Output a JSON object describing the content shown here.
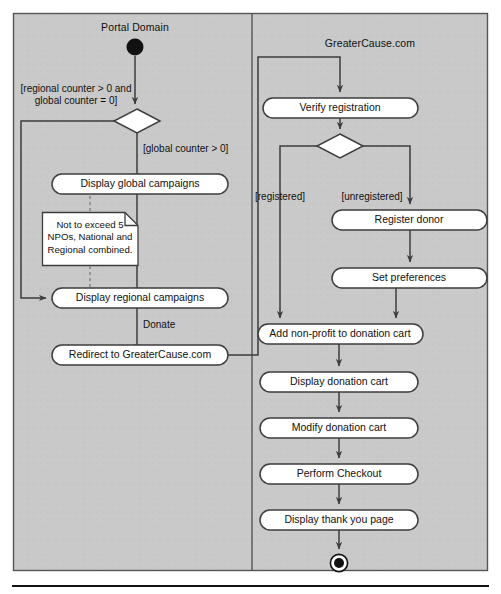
{
  "diagram": {
    "type": "uml-activity-diagram",
    "title": "",
    "frame": {
      "fill": "#c9c9c9",
      "stroke": "#4a4a4a",
      "x": 13,
      "y": 13,
      "width": 475,
      "height": 558
    },
    "swimlanes": [
      {
        "id": "portal",
        "name": "Portal Domain",
        "title_x": 135,
        "title_y": 24
      },
      {
        "id": "greatercause",
        "name": "GreaterCause.com",
        "title_x": 370,
        "title_y": 40
      }
    ],
    "divider_x": 252,
    "nodes": {
      "start": {
        "kind": "initial-node",
        "cx": 135,
        "cy": 47,
        "r": 8.5
      },
      "end": {
        "kind": "final-node",
        "cx": 339,
        "cy": 563,
        "r_outer": 9,
        "r_inner": 5
      },
      "decision_portal": {
        "kind": "decision",
        "cx": 137,
        "cy": 121,
        "hw": 23,
        "hh": 12
      },
      "decision_gc": {
        "kind": "decision",
        "cx": 340,
        "cy": 146,
        "hw": 23,
        "hh": 12
      }
    },
    "activities": [
      {
        "id": "display-global-campaigns",
        "label": "Display global campaigns",
        "x": 52,
        "y": 174,
        "w": 176,
        "h": 20,
        "lane": "portal"
      },
      {
        "id": "display-regional-campaigns",
        "label": "Display regional campaigns",
        "x": 52,
        "y": 288,
        "w": 176,
        "h": 20,
        "lane": "portal"
      },
      {
        "id": "redirect-to-greatercause",
        "label": "Redirect to GreaterCause.com",
        "x": 52,
        "y": 345,
        "w": 176,
        "h": 20,
        "lane": "portal"
      },
      {
        "id": "verify-registration",
        "label": "Verify registration",
        "x": 263,
        "y": 98,
        "w": 155,
        "h": 20,
        "lane": "greatercause"
      },
      {
        "id": "register-donor",
        "label": "Register donor",
        "x": 332,
        "y": 210,
        "w": 155,
        "h": 20,
        "lane": "greatercause"
      },
      {
        "id": "set-preferences",
        "label": "Set preferences",
        "x": 332,
        "y": 268,
        "w": 155,
        "h": 20,
        "lane": "greatercause"
      },
      {
        "id": "add-non-profit-to-donation-cart",
        "label": "Add non-profit to donation cart",
        "x": 258,
        "y": 324,
        "w": 165,
        "h": 20,
        "lane": "greatercause"
      },
      {
        "id": "display-donation-cart",
        "label": "Display donation cart",
        "x": 260,
        "y": 372,
        "w": 158,
        "h": 20,
        "lane": "greatercause"
      },
      {
        "id": "modify-donation-cart",
        "label": "Modify donation cart",
        "x": 260,
        "y": 418,
        "w": 158,
        "h": 20,
        "lane": "greatercause"
      },
      {
        "id": "perform-checkout",
        "label": "Perform Checkout",
        "x": 260,
        "y": 464,
        "w": 158,
        "h": 20,
        "lane": "greatercause"
      },
      {
        "id": "display-thank-you-page",
        "label": "Display thank you page",
        "x": 260,
        "y": 510,
        "w": 158,
        "h": 20,
        "lane": "greatercause"
      }
    ],
    "note": {
      "id": "npo-limit-note",
      "text": "Not to exceed 5 NPOs, National and Regional combined.",
      "x": 42,
      "y": 212,
      "w": 96,
      "h": 53,
      "fold": 13
    },
    "guards": [
      {
        "id": "guard-regional",
        "line1": "[regional counter > 0 and",
        "line2": "global counter = 0]",
        "x": 76,
        "y": 84,
        "align": "center"
      },
      {
        "id": "guard-global",
        "text": "[global counter > 0]",
        "x": 143,
        "y": 144,
        "align": "left"
      },
      {
        "id": "guard-donate",
        "text": "Donate",
        "x": 143,
        "y": 320,
        "align": "left"
      },
      {
        "id": "guard-registered",
        "text": "[registered]",
        "x": 280,
        "y": 192,
        "align": "center"
      },
      {
        "id": "guard-unregistered",
        "text": "[unregistered]",
        "x": 368,
        "y": 192,
        "align": "center"
      }
    ],
    "colors": {
      "lane_fill": "#c9c9c9",
      "node_fill": "#ffffff",
      "stroke": "#3d3d3d",
      "text": "#111111",
      "note_fill": "#ffffff"
    }
  }
}
